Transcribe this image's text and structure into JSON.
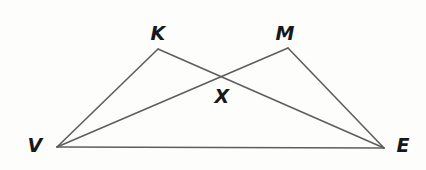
{
  "figure": {
    "kind": "geometry-diagram",
    "width": 426,
    "height": 170,
    "background_color": "#fdfdfc",
    "stroke_color": "#5e5e60",
    "stroke_width": 1.6,
    "label_color": "#18181a"
  },
  "points": [
    {
      "name": "V",
      "label": "V",
      "x": 57,
      "y": 147,
      "label_x": 35,
      "label_y": 145
    },
    {
      "name": "K",
      "label": "K",
      "x": 158,
      "y": 49,
      "label_x": 158,
      "label_y": 33
    },
    {
      "name": "M",
      "label": "M",
      "x": 288,
      "y": 48,
      "label_x": 285,
      "label_y": 33
    },
    {
      "name": "X",
      "label": "X",
      "x": 222,
      "y": 76,
      "label_x": 222,
      "label_y": 96
    },
    {
      "name": "E",
      "label": "E",
      "x": 384,
      "y": 148,
      "label_x": 403,
      "label_y": 145
    }
  ],
  "segments": [
    {
      "name": "segment-VK",
      "from": "V",
      "to": "K",
      "x1": 57,
      "y1": 147,
      "x2": 158,
      "y2": 49
    },
    {
      "name": "segment-KE",
      "from": "K",
      "to": "E",
      "x1": 158,
      "y1": 49,
      "x2": 384,
      "y2": 148
    },
    {
      "name": "segment-VM",
      "from": "V",
      "to": "M",
      "x1": 57,
      "y1": 147,
      "x2": 288,
      "y2": 48
    },
    {
      "name": "segment-ME",
      "from": "M",
      "to": "E",
      "x1": 288,
      "y1": 48,
      "x2": 384,
      "y2": 148
    },
    {
      "name": "segment-VE",
      "from": "V",
      "to": "E",
      "x1": 57,
      "y1": 147,
      "x2": 384,
      "y2": 148
    }
  ]
}
